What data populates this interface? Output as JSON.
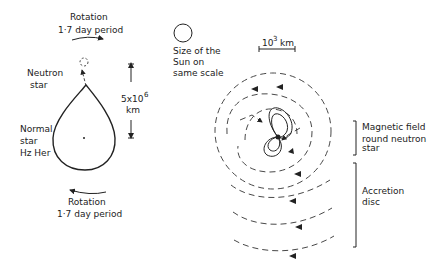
{
  "left_panel": {
    "rotation_top": {
      "title": "Rotation",
      "period": "1·7 day period"
    },
    "neutron_star_label": [
      "Neutron",
      "star"
    ],
    "normal_star_label": [
      "Normal",
      "star",
      "Hz Her"
    ],
    "scale": {
      "value": "5x10",
      "exponent": "6",
      "unit": "km"
    },
    "rotation_bottom": {
      "title": "Rotation",
      "period": "1·7 day period"
    }
  },
  "sun_reference": {
    "label": [
      "Size of the",
      "Sun on",
      "same scale"
    ]
  },
  "right_panel": {
    "scale_bar": {
      "value": "10",
      "exponent": "3",
      "unit": "km"
    },
    "magnetic_field_label": [
      "Magnetic field",
      "round neutron",
      "star"
    ],
    "accretion_disc_label": [
      "Accretion",
      "disc"
    ]
  },
  "colors": {
    "ink": "#222222",
    "background": "#ffffff"
  }
}
